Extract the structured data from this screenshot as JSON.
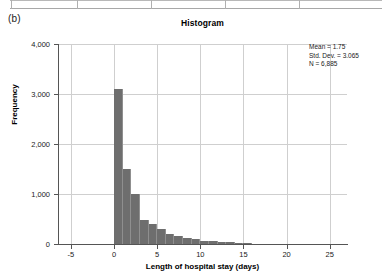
{
  "panel": {
    "label": "(b)"
  },
  "chart_data": {
    "type": "bar",
    "title": "Histogram",
    "xlabel": "Length of hospital stay (days)",
    "ylabel": "Frequency",
    "xlim": [
      -6.5,
      27
    ],
    "ylim": [
      0,
      4000
    ],
    "grid": true,
    "bin_width": 1,
    "x_ticks": [
      "-5",
      "0",
      "5",
      "10",
      "15",
      "20",
      "25"
    ],
    "x_tick_values": [
      -5,
      0,
      5,
      10,
      15,
      20,
      25
    ],
    "y_ticks": [
      "0",
      "1,000",
      "2,000",
      "3,000",
      "4,000"
    ],
    "y_tick_values": [
      0,
      1000,
      2000,
      3000,
      4000
    ],
    "categories": [
      0,
      1,
      2,
      3,
      4,
      5,
      6,
      7,
      8,
      9,
      10,
      11,
      12,
      13,
      14,
      15
    ],
    "values": [
      3100,
      1500,
      1000,
      480,
      400,
      300,
      200,
      160,
      120,
      95,
      70,
      55,
      45,
      35,
      25,
      15
    ],
    "bar_color": "#6e6e6e",
    "annotations": {
      "mean_label": "Mean = 1.75",
      "stddev_label": "Std. Dev. = 3.065",
      "n_label": "N = 6,885",
      "mean": 1.75,
      "std_dev": 3.065,
      "n": 6885
    }
  }
}
